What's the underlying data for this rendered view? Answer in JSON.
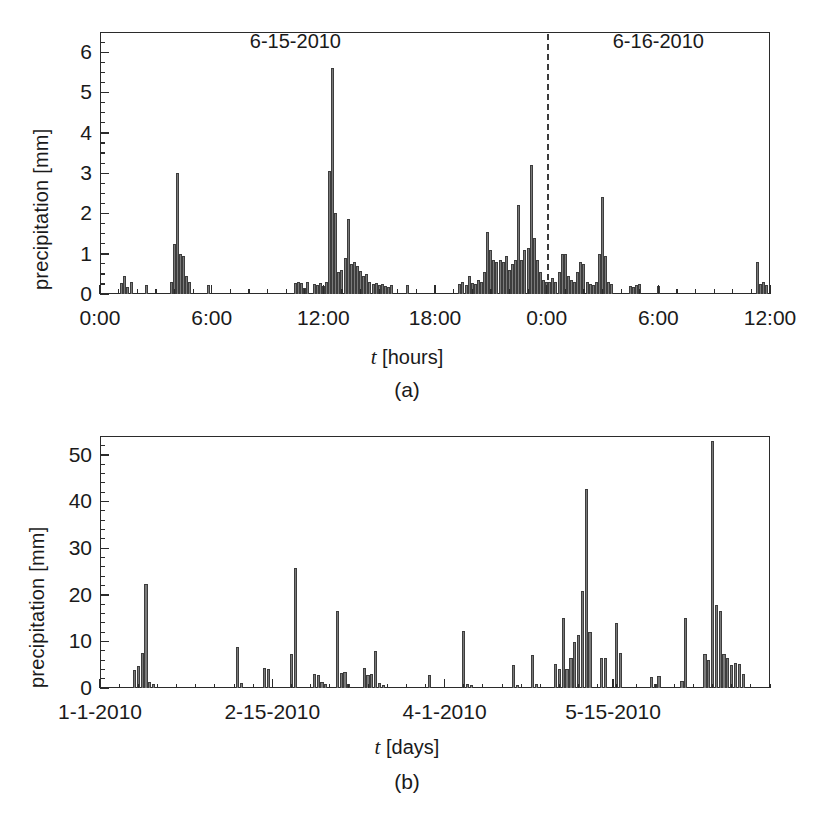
{
  "figure": {
    "panels": [
      {
        "id": "a",
        "subcaption": "(a)",
        "ylabel": "precipitation [mm]",
        "xlabel_sym": "t",
        "xlabel_unit": "[hours]",
        "annotations": [
          {
            "name": "date-label-day1",
            "text": "6-15-2010",
            "x_hours": 10.5
          },
          {
            "name": "date-label-day2",
            "text": "6-16-2010",
            "x_hours": 30.0
          }
        ],
        "divider": {
          "name": "midnight-divider",
          "x_hours": 24.0,
          "style": "dashed"
        }
      },
      {
        "id": "b",
        "subcaption": "(b)",
        "ylabel": "precipitation [mm]",
        "xlabel_sym": "t",
        "xlabel_unit": "[days]"
      }
    ]
  },
  "chart_data": [
    {
      "type": "bar",
      "panel": "a",
      "title": "",
      "xlabel": "t [hours]",
      "ylabel": "precipitation [mm]",
      "xlim": [
        0,
        36
      ],
      "ylim": [
        0,
        6.5
      ],
      "yticks": [
        0,
        1,
        2,
        3,
        4,
        5,
        6
      ],
      "yticklabels": [
        "0",
        "1",
        "2",
        "3",
        "4",
        "5",
        "6"
      ],
      "xticks": [
        0,
        6,
        12,
        18,
        24,
        30,
        36
      ],
      "xticklabels": [
        "0:00",
        "6:00",
        "12:00",
        "18:00",
        "0:00",
        "6:00",
        "12:00"
      ],
      "yminor_step": 0.25,
      "xminor_step": 1,
      "grid": false,
      "legend": null,
      "bar_width_hours": 0.1667,
      "bar_color": "#7a7a7a",
      "bar_edge_color": "#3d3d3d",
      "x": [
        1.17,
        1.33,
        1.5,
        1.67,
        2.5,
        3.83,
        4.0,
        4.17,
        4.33,
        4.5,
        4.67,
        4.83,
        5.83,
        10.5,
        10.67,
        10.83,
        11.0,
        11.17,
        11.5,
        11.67,
        11.83,
        12.0,
        12.17,
        12.33,
        12.5,
        12.67,
        12.83,
        13.0,
        13.17,
        13.33,
        13.5,
        13.67,
        13.83,
        14.0,
        14.17,
        14.33,
        14.5,
        14.67,
        14.83,
        15.0,
        15.17,
        15.33,
        15.5,
        15.67,
        16.5,
        19.33,
        19.5,
        19.67,
        19.83,
        20.0,
        20.17,
        20.33,
        20.5,
        20.67,
        20.83,
        21.0,
        21.17,
        21.33,
        21.5,
        21.67,
        21.83,
        22.0,
        22.17,
        22.33,
        22.5,
        22.67,
        22.83,
        23.0,
        23.17,
        23.33,
        23.5,
        23.67,
        23.83,
        24.0,
        24.17,
        24.33,
        24.5,
        24.67,
        24.83,
        25.0,
        25.17,
        25.33,
        25.5,
        25.67,
        25.83,
        26.0,
        26.17,
        26.33,
        26.5,
        26.67,
        26.83,
        27.0,
        27.17,
        27.33,
        27.5,
        28.5,
        28.67,
        28.83,
        29.0,
        30.0,
        35.33,
        35.5,
        35.67,
        35.83
      ],
      "values": [
        0.28,
        0.45,
        0.18,
        0.3,
        0.22,
        0.3,
        1.25,
        3.0,
        1.0,
        0.95,
        0.45,
        0.3,
        0.22,
        0.28,
        0.3,
        0.28,
        0.15,
        0.3,
        0.25,
        0.22,
        0.28,
        0.2,
        0.3,
        3.05,
        5.6,
        2.0,
        0.55,
        0.6,
        0.9,
        1.85,
        0.75,
        0.8,
        0.7,
        0.58,
        0.45,
        0.5,
        0.3,
        0.25,
        0.28,
        0.22,
        0.25,
        0.2,
        0.18,
        0.22,
        0.22,
        0.25,
        0.3,
        0.22,
        0.45,
        0.28,
        0.25,
        0.35,
        0.3,
        0.55,
        1.55,
        1.1,
        0.85,
        0.8,
        0.85,
        0.8,
        0.95,
        0.6,
        0.75,
        0.85,
        2.2,
        0.85,
        1.1,
        1.15,
        3.2,
        1.4,
        0.85,
        0.55,
        0.35,
        0.3,
        0.3,
        0.4,
        0.3,
        0.55,
        1.0,
        1.0,
        0.45,
        0.35,
        0.3,
        0.55,
        0.8,
        0.75,
        0.3,
        0.25,
        0.22,
        0.3,
        1.0,
        2.4,
        0.95,
        0.3,
        0.25,
        0.2,
        0.18,
        0.22,
        0.25,
        0.2,
        0.8,
        0.25,
        0.3,
        0.22
      ]
    },
    {
      "type": "bar",
      "panel": "b",
      "title": "",
      "xlabel": "t [days]",
      "ylabel": "precipitation [mm]",
      "xlim": [
        0,
        175
      ],
      "ylim": [
        0,
        54
      ],
      "yticks": [
        0,
        10,
        20,
        30,
        40,
        50
      ],
      "yticklabels": [
        "0",
        "10",
        "20",
        "30",
        "40",
        "50"
      ],
      "xticks": [
        0,
        45,
        90,
        134
      ],
      "xticklabels": [
        "1-1-2010",
        "2-15-2010",
        "4-1-2010",
        "5-15-2010"
      ],
      "yminor_step": 2,
      "grid": false,
      "legend": null,
      "bar_width_days": 0.9,
      "bar_color": "#7a7a7a",
      "bar_edge_color": "#3d3d3d",
      "x": [
        9,
        10,
        11,
        12,
        13,
        14,
        36,
        37,
        43,
        44,
        50,
        51,
        56,
        57,
        58,
        59,
        62,
        63,
        64,
        65,
        69,
        70,
        71,
        72,
        73,
        74,
        86,
        95,
        96,
        97,
        108,
        109,
        113,
        114,
        119,
        120,
        121,
        122,
        123,
        124,
        125,
        126,
        127,
        128,
        131,
        132,
        135,
        136,
        144,
        145,
        146,
        152,
        153,
        158,
        159,
        160,
        161,
        162,
        163,
        164,
        165,
        166,
        167,
        168
      ],
      "values": [
        3.9,
        4.8,
        7.4,
        22.3,
        1.2,
        0.8,
        8.8,
        1.0,
        4.2,
        4.0,
        7.2,
        25.7,
        3.1,
        2.8,
        1.2,
        0.9,
        16.6,
        3.2,
        3.4,
        0.9,
        4.2,
        2.8,
        2.9,
        8.0,
        1.1,
        0.7,
        2.8,
        12.3,
        0.8,
        0.6,
        5.0,
        0.7,
        7.0,
        0.8,
        5.2,
        4.0,
        15.0,
        4.0,
        6.4,
        9.8,
        11.4,
        20.7,
        42.7,
        11.9,
        6.4,
        6.4,
        14.0,
        7.4,
        2.4,
        0.9,
        2.5,
        1.5,
        14.9,
        7.2,
        6.1,
        53.0,
        17.8,
        16.6,
        7.2,
        6.4,
        5.0,
        5.4,
        5.2,
        3.0
      ]
    }
  ]
}
